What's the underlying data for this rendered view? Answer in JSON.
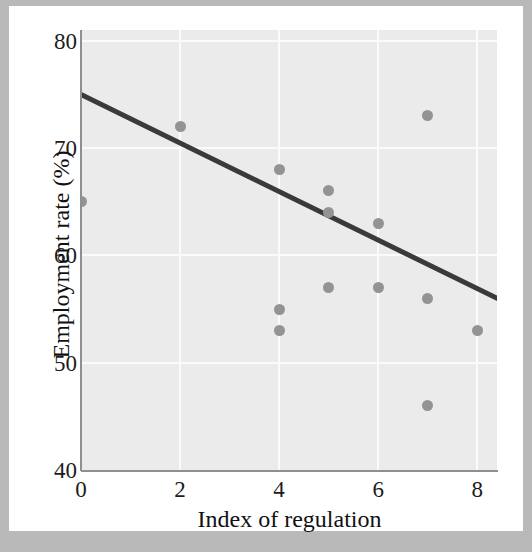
{
  "chart_data": {
    "type": "scatter",
    "title": "",
    "xlabel": "Index of regulation",
    "ylabel": "Employment rate (%)",
    "xlim": [
      0,
      8.4
    ],
    "ylim": [
      40,
      81
    ],
    "xticks": [
      0,
      2,
      4,
      6,
      8
    ],
    "xtick_labels": [
      "0",
      "2",
      "4",
      "6",
      "8"
    ],
    "yticks": [
      40,
      50,
      60,
      70,
      80
    ],
    "ytick_labels": [
      "40",
      "50",
      "60",
      "70",
      "80"
    ],
    "grid": true,
    "grid_color": "#fbfbfb",
    "plot_background": "#ebebeb",
    "legend": "none",
    "point_color": "#939393",
    "line_color": "#3a3a3a",
    "points": [
      {
        "x": 0,
        "y": 65
      },
      {
        "x": 2,
        "y": 72
      },
      {
        "x": 4,
        "y": 68
      },
      {
        "x": 4,
        "y": 55
      },
      {
        "x": 4,
        "y": 53
      },
      {
        "x": 5,
        "y": 66
      },
      {
        "x": 5,
        "y": 64
      },
      {
        "x": 5,
        "y": 57
      },
      {
        "x": 6,
        "y": 63
      },
      {
        "x": 6,
        "y": 57
      },
      {
        "x": 7,
        "y": 73
      },
      {
        "x": 7,
        "y": 56
      },
      {
        "x": 7,
        "y": 46
      },
      {
        "x": 8,
        "y": 53
      }
    ],
    "trend_line": {
      "name": "fitted regression line",
      "start": {
        "x": 0,
        "y": 75
      },
      "end": {
        "x": 8.4,
        "y": 56
      }
    }
  }
}
